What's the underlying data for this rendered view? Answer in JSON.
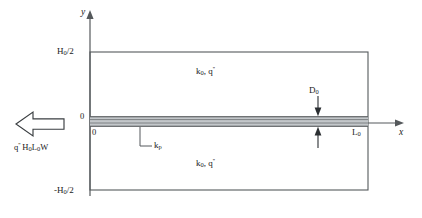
{
  "figure": {
    "colors": {
      "line": "#55595c",
      "text": "#1a1a1a",
      "plate_fill": "#b8bcbf",
      "background": "#ffffff"
    }
  },
  "axes": {
    "y_label": "y",
    "x_label": "x",
    "origin_y_label": "0",
    "origin_x_label": "0",
    "y_top_tick": "H",
    "y_top_tick_sub": "0",
    "y_top_tick_tail": "/2",
    "y_bottom_tick_lead": "-H",
    "y_bottom_tick_sub": "0",
    "y_bottom_tick_tail": "/2",
    "x_right_tick": "L",
    "x_right_tick_sub": "0"
  },
  "regions": {
    "upper": {
      "k_symbol": "k",
      "k_sub": "0",
      "separator": ", ",
      "q_symbol": "q",
      "q_prime": "''"
    },
    "lower": {
      "k_symbol": "k",
      "k_sub": "0",
      "separator": ", ",
      "q_symbol": "q",
      "q_prime": "''"
    }
  },
  "plate": {
    "conductivity_label": "k",
    "conductivity_sub": "p",
    "thickness_label": "D",
    "thickness_sub": "0"
  },
  "heat_flux": {
    "arrow_direction": "left",
    "label_q": "q",
    "label_prime": "''",
    "label_h": "H",
    "label_h_sub": "0",
    "label_l": "L",
    "label_l_sub": "0",
    "label_w": "W"
  }
}
